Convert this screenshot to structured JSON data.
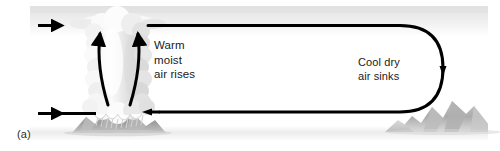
{
  "figure": {
    "panel_label": "(a)",
    "caption_type": "atmospheric-circulation-cell",
    "background_color": "#ffffff"
  },
  "labels": {
    "warm": {
      "line1": "Warm",
      "line2": "moist",
      "line3": "air rises",
      "text": "Warm\nmoist\nair rises",
      "color": "#1a1a1a"
    },
    "cool": {
      "line1": "Cool dry",
      "line2": "air sinks",
      "text": "Cool dry\nair sinks",
      "color": "#1a1a1a"
    }
  },
  "scene": {
    "sky_band_color": "#eeeeee",
    "haze_band_color": "#f2f2f2",
    "cloud_color": "#f4f4f4",
    "cloud_shadow_color": "#d8d8d8",
    "mountain_color": "#9a9a9a",
    "mountain_light_color": "#c9c9c9",
    "rain_color": "#dcdcdc",
    "flow_line_color": "#000000",
    "flow_line_width": 3
  },
  "flow": {
    "top_arrow_label": "upper-level-inflow",
    "bottom_arrow_label": "surface-inflow",
    "loop_label": "subsidence-branch",
    "updraft_left_label": "updraft-left",
    "updraft_right_label": "updraft-right"
  }
}
